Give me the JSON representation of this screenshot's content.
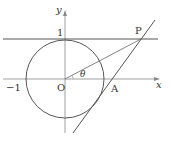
{
  "diagram": {
    "labels": {
      "y_axis": "y",
      "x_axis": "x",
      "one": "1",
      "neg_one": "−1",
      "origin": "O",
      "theta": "θ",
      "point_p": "P",
      "point_a": "A"
    },
    "colors": {
      "stroke": "#444444",
      "background": "#ffffff"
    }
  }
}
